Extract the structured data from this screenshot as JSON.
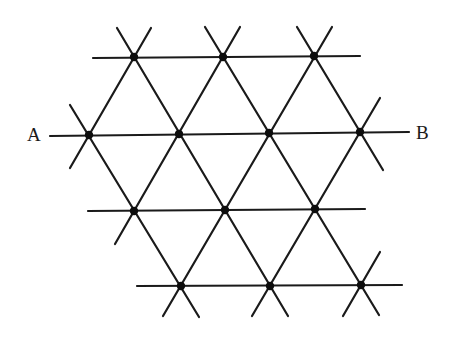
{
  "diagram": {
    "labels": {
      "a": "A",
      "b": "B"
    },
    "colors": {
      "stroke": "#1a1a1a",
      "node": "#0d0d0d",
      "background": "#ffffff"
    },
    "nodes": [
      {
        "id": "r0c0",
        "x": 134,
        "y": 57
      },
      {
        "id": "r0c1",
        "x": 223,
        "y": 57
      },
      {
        "id": "r0c2",
        "x": 314,
        "y": 56
      },
      {
        "id": "r1c0",
        "x": 89,
        "y": 135
      },
      {
        "id": "r1c1",
        "x": 179,
        "y": 134
      },
      {
        "id": "r1c2",
        "x": 269,
        "y": 133
      },
      {
        "id": "r1c3",
        "x": 360,
        "y": 132
      },
      {
        "id": "r2c0",
        "x": 134,
        "y": 211
      },
      {
        "id": "r2c1",
        "x": 225,
        "y": 210
      },
      {
        "id": "r2c2",
        "x": 315,
        "y": 209
      },
      {
        "id": "r3c0",
        "x": 181,
        "y": 286
      },
      {
        "id": "r3c1",
        "x": 270,
        "y": 286
      },
      {
        "id": "r3c2",
        "x": 361,
        "y": 285
      }
    ],
    "lines": [
      {
        "id": "h-row0",
        "x1": 93,
        "y1": 58,
        "x2": 360,
        "y2": 56
      },
      {
        "id": "h-row1-AB",
        "x1": 50,
        "y1": 136,
        "x2": 409,
        "y2": 132
      },
      {
        "id": "h-row2",
        "x1": 88,
        "y1": 211,
        "x2": 365,
        "y2": 209
      },
      {
        "id": "h-row3",
        "x1": 137,
        "y1": 286,
        "x2": 402,
        "y2": 285
      },
      {
        "id": "d-down-1",
        "x1": 117,
        "y1": 28,
        "x2": 288,
        "y2": 316
      },
      {
        "id": "d-down-2",
        "x1": 205,
        "y1": 27,
        "x2": 379,
        "y2": 315
      },
      {
        "id": "d-down-3",
        "x1": 297,
        "y1": 27,
        "x2": 383,
        "y2": 170
      },
      {
        "id": "d-down-4",
        "x1": 70,
        "y1": 105,
        "x2": 199,
        "y2": 317
      },
      {
        "id": "d-up-1",
        "x1": 151,
        "y1": 28,
        "x2": 70,
        "y2": 168
      },
      {
        "id": "d-up-2",
        "x1": 240,
        "y1": 27,
        "x2": 115,
        "y2": 244
      },
      {
        "id": "d-up-3",
        "x1": 332,
        "y1": 27,
        "x2": 163,
        "y2": 316
      },
      {
        "id": "d-up-4",
        "x1": 380,
        "y1": 98,
        "x2": 252,
        "y2": 316
      },
      {
        "id": "d-up-5",
        "x1": 380,
        "y1": 252,
        "x2": 343,
        "y2": 316
      }
    ],
    "node_radius": 4.2,
    "stroke_width": 2.2
  }
}
